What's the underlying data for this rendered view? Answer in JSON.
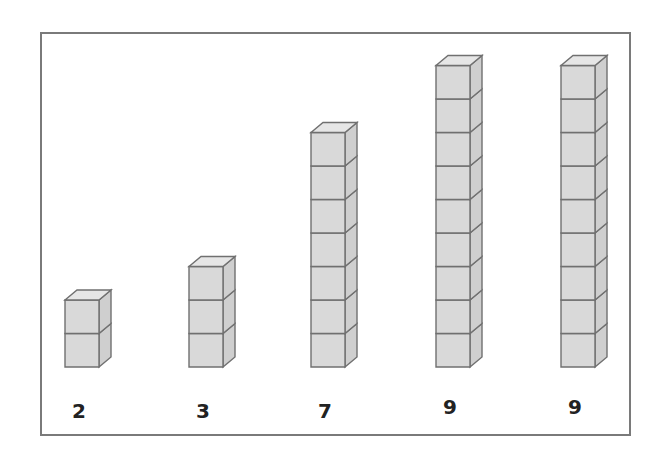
{
  "figure": {
    "towers": [
      {
        "cubes": 2,
        "label": "2"
      },
      {
        "cubes": 3,
        "label": "3"
      },
      {
        "cubes": 7,
        "label": "7"
      },
      {
        "cubes": 9,
        "label": "9"
      },
      {
        "cubes": 9,
        "label": "9"
      }
    ],
    "colors": {
      "cube_front": "#d9d9d9",
      "cube_top": "#e6e6e6",
      "cube_side": "#cfcfcf",
      "cube_edge": "#707070",
      "frame": "#7a7a7a",
      "label": "#222222"
    }
  }
}
